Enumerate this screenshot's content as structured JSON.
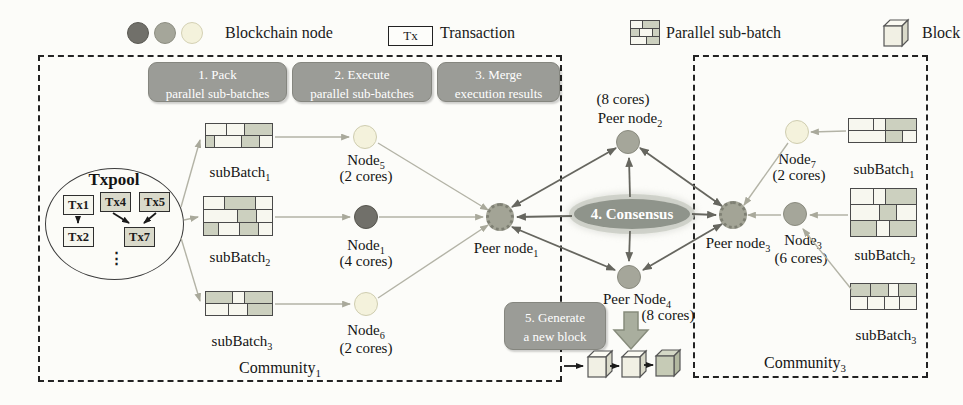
{
  "legend": {
    "blockchain_node_label": "Blockchain node",
    "tx_abbr": "Tx",
    "transaction_label": "Transaction",
    "parallel_subbatch_label": "Parallel sub-batch",
    "block_label": "Block",
    "node_colors": {
      "dark": "#71706a",
      "medium": "#a5a69a",
      "light": "#f4f2dc"
    },
    "brick_pattern": {
      "rowH": 9,
      "rows": [
        [
          [
            40,
            0
          ],
          [
            60,
            1
          ]
        ],
        [
          [
            30,
            1
          ],
          [
            45,
            0
          ],
          [
            25,
            1
          ]
        ],
        [
          [
            55,
            0
          ],
          [
            45,
            1
          ]
        ]
      ]
    }
  },
  "steps": {
    "pack": {
      "line1": "1. Pack",
      "line2": "parallel sub-batches"
    },
    "execute": {
      "line1": "2. Execute",
      "line2": "parallel sub-batches"
    },
    "merge": {
      "line1": "3. Merge",
      "line2": "execution results"
    },
    "consensus": "4. Consensus",
    "generate": {
      "line1": "5. Generate",
      "line2": "a new block"
    }
  },
  "txpool": {
    "title": "Txpool",
    "tx1": "Tx1",
    "tx4": "Tx4",
    "tx5": "Tx5",
    "tx2": "Tx2",
    "tx7": "Tx7",
    "ellipsis": "⋮"
  },
  "community1": {
    "name": {
      "base": "Community",
      "sub": "1"
    },
    "subbatches": [
      {
        "label": {
          "base": "subBatch",
          "sub": "1"
        },
        "pattern": {
          "rowH": 13,
          "rows": [
            [
              [
                30,
                0
              ],
              [
                24,
                0
              ],
              [
                40,
                1
              ]
            ],
            [
              [
                12,
                1
              ],
              [
                38,
                0
              ],
              [
                26,
                1
              ],
              [
                18,
                0
              ]
            ]
          ]
        }
      },
      {
        "label": {
          "base": "subBatch",
          "sub": "2"
        },
        "pattern": {
          "rowH": 14,
          "rows": [
            [
              [
                30,
                0
              ],
              [
                45,
                1
              ],
              [
                25,
                0
              ]
            ],
            [
              [
                50,
                0
              ],
              [
                27,
                1
              ],
              [
                23,
                0
              ]
            ],
            [
              [
                22,
                1
              ],
              [
                30,
                0
              ],
              [
                28,
                1
              ],
              [
                20,
                0
              ]
            ]
          ]
        }
      },
      {
        "label": {
          "base": "subBatch",
          "sub": "3"
        },
        "pattern": {
          "rowH": 13,
          "rows": [
            [
              [
                40,
                1
              ],
              [
                18,
                0
              ],
              [
                42,
                1
              ]
            ],
            [
              [
                35,
                0
              ],
              [
                28,
                0
              ],
              [
                37,
                1
              ]
            ]
          ]
        }
      }
    ],
    "nodes": [
      {
        "name": {
          "base": "Node",
          "sub": "5"
        },
        "cores": "(2 cores)"
      },
      {
        "name": {
          "base": "Node",
          "sub": "1"
        },
        "cores": "(4 cores)"
      },
      {
        "name": {
          "base": "Node",
          "sub": "6"
        },
        "cores": "(2 cores)"
      }
    ],
    "peer": {
      "base": "Peer node",
      "sub": "1"
    }
  },
  "center": {
    "peer2": {
      "cores": "(8 cores)",
      "name": {
        "base": "Peer node",
        "sub": "2"
      }
    },
    "peer4": {
      "name": {
        "base": "Peer Node",
        "sub": "4"
      },
      "cores": "(8 cores)"
    }
  },
  "community3": {
    "name": {
      "base": "Community",
      "sub": "3"
    },
    "subbatches": [
      {
        "label": {
          "base": "subBatch",
          "sub": "1"
        },
        "pattern": {
          "rowH": 13,
          "rows": [
            [
              [
                37,
                0
              ],
              [
                17,
                0
              ],
              [
                46,
                1
              ]
            ],
            [
              [
                55,
                0
              ],
              [
                25,
                1
              ],
              [
                20,
                0
              ]
            ]
          ]
        }
      },
      {
        "label": {
          "base": "subBatch",
          "sub": "2"
        },
        "pattern": {
          "rowH": 17,
          "rows": [
            [
              [
                35,
                0
              ],
              [
                17,
                0
              ],
              [
                48,
                1
              ]
            ],
            [
              [
                45,
                0
              ],
              [
                25,
                1
              ],
              [
                30,
                0
              ]
            ],
            [
              [
                40,
                1
              ],
              [
                18,
                0
              ],
              [
                42,
                1
              ]
            ]
          ]
        }
      },
      {
        "label": {
          "base": "subBatch",
          "sub": "3"
        },
        "pattern": {
          "rowH": 14,
          "rows": [
            [
              [
                30,
                1
              ],
              [
                28,
                1
              ],
              [
                14,
                0
              ],
              [
                28,
                1
              ]
            ],
            [
              [
                25,
                0
              ],
              [
                27,
                0
              ],
              [
                22,
                0
              ],
              [
                26,
                0
              ]
            ]
          ]
        }
      }
    ],
    "nodes": [
      {
        "name": {
          "base": "Node",
          "sub": "7"
        },
        "cores": "(2 cores)"
      },
      {
        "name": {
          "base": "Node",
          "sub": "3"
        },
        "cores": "(6 cores)"
      }
    ],
    "peer": {
      "base": "Peer node",
      "sub": "3"
    }
  }
}
